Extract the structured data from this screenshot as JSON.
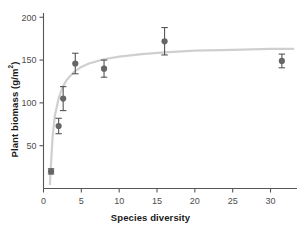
{
  "chart_data": {
    "type": "scatter",
    "title": "",
    "xlabel": "Species diversity",
    "ylabel_text": "Plant biomass (g/m",
    "ylabel_sup": "2",
    "ylabel_tail": ")",
    "ylabel_full": "Plant biomass (g/m2)",
    "xlim": [
      0,
      33.5
    ],
    "ylim": [
      0,
      205
    ],
    "grid": false,
    "legend": null,
    "xticks": [
      0,
      5,
      10,
      15,
      20,
      25,
      30
    ],
    "xtick_labels": [
      "0",
      "5",
      "10",
      "15",
      "20",
      "25",
      "30"
    ],
    "yticks": [
      50,
      100,
      150,
      200
    ],
    "ytick_labels": [
      "50",
      "100",
      "150",
      "200"
    ],
    "marker_color": "#666666",
    "errorbar_color": "#555555",
    "curve_color": "#cfcfcf",
    "axis_color": "#555555",
    "x": [
      1,
      2,
      2.6,
      4.2,
      8,
      16,
      31.5
    ],
    "y": [
      20,
      73,
      105,
      146,
      140,
      172,
      149
    ],
    "yerr": [
      3,
      9,
      14,
      12,
      10,
      16,
      8
    ],
    "points": [
      {
        "x": 1,
        "y": 20,
        "err": 3
      },
      {
        "x": 2,
        "y": 73,
        "err": 9
      },
      {
        "x": 2.6,
        "y": 105,
        "err": 14
      },
      {
        "x": 4.2,
        "y": 146,
        "err": 12
      },
      {
        "x": 8,
        "y": 140,
        "err": 10
      },
      {
        "x": 16,
        "y": 172,
        "err": 16
      },
      {
        "x": 31.5,
        "y": 149,
        "err": 8
      }
    ],
    "fit_curve": {
      "description": "saturating Michaelis-Menten style fit",
      "asymptote": 167,
      "half_saturation": 0.62,
      "points": [
        {
          "x": 0.85,
          "y": 5
        },
        {
          "x": 1.0,
          "y": 30
        },
        {
          "x": 1.2,
          "y": 60
        },
        {
          "x": 1.5,
          "y": 85
        },
        {
          "x": 2.0,
          "y": 105
        },
        {
          "x": 2.5,
          "y": 118
        },
        {
          "x": 3.0,
          "y": 126
        },
        {
          "x": 4.0,
          "y": 136
        },
        {
          "x": 5.0,
          "y": 142
        },
        {
          "x": 6.0,
          "y": 146
        },
        {
          "x": 8.0,
          "y": 151
        },
        {
          "x": 10.0,
          "y": 154
        },
        {
          "x": 13.0,
          "y": 157
        },
        {
          "x": 16.0,
          "y": 159
        },
        {
          "x": 20.0,
          "y": 161
        },
        {
          "x": 25.0,
          "y": 162
        },
        {
          "x": 30.0,
          "y": 163
        },
        {
          "x": 33.0,
          "y": 163
        }
      ]
    }
  }
}
